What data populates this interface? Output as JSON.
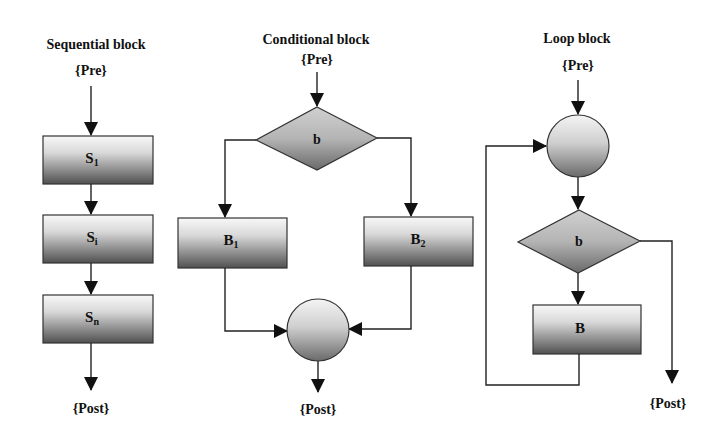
{
  "diagram": {
    "colors": {
      "background": "#ffffff",
      "stroke": "#222222",
      "gradient_top": "#f6f6f6",
      "gradient_bottom": "#555555",
      "text": "#111111"
    },
    "sequential": {
      "title": "Sequential block",
      "pre": "{Pre}",
      "post": "{Post}",
      "nodes": [
        {
          "id": "S1",
          "label": "S",
          "sub": "1"
        },
        {
          "id": "Si",
          "label": "S",
          "sub": "i"
        },
        {
          "id": "Sn",
          "label": "S",
          "sub": "n"
        }
      ]
    },
    "conditional": {
      "title": "Conditional block",
      "pre": "{Pre}",
      "post": "{Post}",
      "condition": "b",
      "branches": [
        {
          "id": "B1",
          "label": "B",
          "sub": "1"
        },
        {
          "id": "B2",
          "label": "B",
          "sub": "2"
        }
      ]
    },
    "loop": {
      "title": "Loop block",
      "pre": "{Pre}",
      "post": "{Post}",
      "condition": "b",
      "body": {
        "id": "B",
        "label": "B"
      }
    }
  }
}
